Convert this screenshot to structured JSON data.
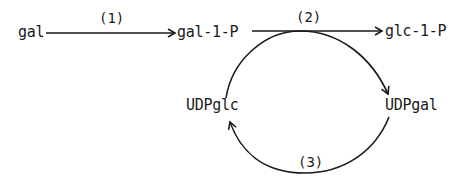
{
  "diagram": {
    "type": "metabolic-pathway",
    "nodes": {
      "gal": "gal",
      "gal1p": "gal-1-P",
      "glc1p": "glc-1-P",
      "udpglc": "UDPglc",
      "udpgal": "UDPgal"
    },
    "steps": {
      "s1": "(1)",
      "s2": "(2)",
      "s3": "(3)"
    },
    "edges": [
      {
        "from": "gal",
        "to": "gal-1-P",
        "label": "(1)"
      },
      {
        "from": "gal-1-P",
        "to": "glc-1-P",
        "label": "(2)"
      },
      {
        "from": "UDPglc",
        "to": "UDPgal",
        "label": "(2)"
      },
      {
        "from": "UDPgal",
        "to": "UDPglc",
        "label": "(3)"
      }
    ],
    "colors": {
      "ink": "#1a1a1a",
      "background": "#ffffff"
    }
  }
}
